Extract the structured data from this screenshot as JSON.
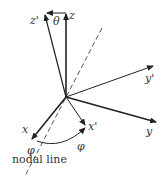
{
  "diagram": {
    "labels": {
      "z": "z",
      "z_prime": "z'",
      "y": "y",
      "y_prime": "y'",
      "x": "x",
      "x_prime": "x'",
      "theta": "θ",
      "phi_left": "φ",
      "phi_right": "φ",
      "nodal_line": "nodal line"
    },
    "colors": {
      "line": "#222222",
      "background": "#ffffff"
    }
  }
}
